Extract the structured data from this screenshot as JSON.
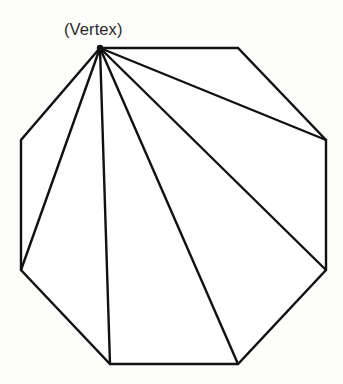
{
  "figure": {
    "label": "(Vertex)",
    "background_color": "#fdfdfc",
    "line_color": "#111111",
    "label_color": "#2a2a2a",
    "stroke_width": 2.4,
    "canvas": {
      "width": 343,
      "height": 384
    },
    "shape": {
      "type": "regular-octagon",
      "sides": 8,
      "vertex_count": 8,
      "diagonal_count": 5,
      "triangle_count": 6,
      "apex_index": 0,
      "vertices": [
        {
          "name": "apex",
          "x": 100,
          "y": 48
        },
        {
          "name": "top-right",
          "x": 238,
          "y": 48
        },
        {
          "name": "right-top",
          "x": 326,
          "y": 140
        },
        {
          "name": "right-bottom",
          "x": 326,
          "y": 270
        },
        {
          "name": "bottom-right",
          "x": 238,
          "y": 364
        },
        {
          "name": "bottom-left",
          "x": 110,
          "y": 364
        },
        {
          "name": "left-bottom",
          "x": 21,
          "y": 270
        },
        {
          "name": "left-top",
          "x": 21,
          "y": 140
        }
      ],
      "outline_points": "100,48 238,48 326,140 326,270 238,364 110,364 21,270 21,140",
      "diagonals": [
        {
          "name": "apex-to-right-top",
          "x1": 100,
          "y1": 48,
          "x2": 326,
          "y2": 140
        },
        {
          "name": "apex-to-right-bottom",
          "x1": 100,
          "y1": 48,
          "x2": 326,
          "y2": 270
        },
        {
          "name": "apex-to-bottom-right",
          "x1": 100,
          "y1": 48,
          "x2": 238,
          "y2": 364
        },
        {
          "name": "apex-to-bottom-left",
          "x1": 100,
          "y1": 48,
          "x2": 110,
          "y2": 364
        },
        {
          "name": "apex-to-left-bottom",
          "x1": 100,
          "y1": 48,
          "x2": 21,
          "y2": 270
        }
      ]
    }
  }
}
